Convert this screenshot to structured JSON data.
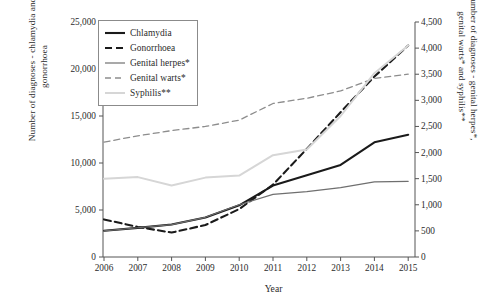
{
  "axes": {
    "y_left_title_line1": "Number of diagnoses - chlamydia and",
    "y_left_title_line2": "gonorrhoea",
    "y_right_title_line1": "Number of diagnoses - genital herpes*,",
    "y_right_title_line2": "genital warts* and syphilis**",
    "x_title": "Year",
    "y_left_ticks": [
      "25,000",
      "20,000",
      "15,000",
      "10,000",
      "5,000",
      "0"
    ],
    "y_right_ticks": [
      "4,500",
      "4,000",
      "3,500",
      "3,000",
      "2,500",
      "2,000",
      "1,500",
      "1,000",
      "500",
      "0"
    ],
    "x_ticks": [
      "2006",
      "2007",
      "2008",
      "2009",
      "2010",
      "2011",
      "2012",
      "2013",
      "2014",
      "2015"
    ]
  },
  "legend": {
    "items": [
      {
        "label": "Chlamydia",
        "key": "solid-thick-black",
        "color": "#1a1a1a"
      },
      {
        "label": "Gonorrhoea",
        "key": "dashed-thick-black",
        "color": "#1a1a1a"
      },
      {
        "label": "Genital herpes*",
        "key": "solid-gray",
        "color": "#6f6f6f"
      },
      {
        "label": "Genital warts*",
        "key": "dashed-gray",
        "color": "#8d8d8d"
      },
      {
        "label": "Syphilis**",
        "key": "solid-lightgray",
        "color": "#d6d6d6"
      }
    ]
  },
  "chart_data": {
    "type": "line",
    "title": "",
    "xlabel": "Year",
    "ylabel": "Number of diagnoses - chlamydia and gonorrhoea",
    "ylabel_secondary": "Number of diagnoses - genital herpes*, genital warts* and syphilis**",
    "x": [
      2006,
      2007,
      2008,
      2009,
      2010,
      2011,
      2012,
      2013,
      2014,
      2015
    ],
    "ylim": [
      0,
      25000
    ],
    "ylim_secondary": [
      0,
      4500
    ],
    "grid": false,
    "legend_position": "top-left",
    "series": [
      {
        "name": "Chlamydia",
        "axis": "left",
        "style": "solid",
        "color": "#1a1a1a",
        "width": 2.1,
        "values": [
          2800,
          3100,
          3450,
          4200,
          5500,
          7600,
          8700,
          9800,
          12200,
          13000
        ]
      },
      {
        "name": "Gonorrhoea",
        "axis": "left",
        "style": "dashed",
        "color": "#1a1a1a",
        "width": 2.1,
        "values": [
          4000,
          3200,
          2600,
          3400,
          5100,
          7700,
          11500,
          15400,
          19200,
          22500
        ]
      },
      {
        "name": "Genital herpes*",
        "axis": "right",
        "style": "solid",
        "color": "#6f6f6f",
        "width": 1.2,
        "values": [
          500,
          560,
          620,
          760,
          1000,
          1200,
          1250,
          1330,
          1440,
          1450
        ]
      },
      {
        "name": "Genital warts*",
        "axis": "right",
        "style": "dashed",
        "color": "#8d8d8d",
        "width": 1.3,
        "values": [
          2200,
          2320,
          2420,
          2500,
          2620,
          2940,
          3040,
          3180,
          3420,
          3500
        ]
      },
      {
        "name": "Syphilis**",
        "axis": "right",
        "style": "solid",
        "color": "#d6d6d6",
        "width": 2.0,
        "values": [
          1500,
          1530,
          1370,
          1520,
          1560,
          1950,
          2060,
          2700,
          3520,
          4050
        ]
      }
    ]
  }
}
